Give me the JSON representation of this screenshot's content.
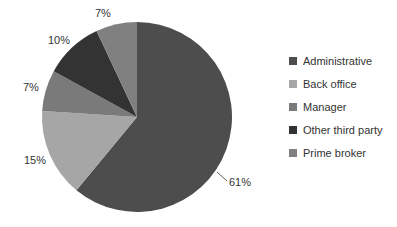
{
  "chart_data": {
    "type": "pie",
    "title": "",
    "categories": [
      "Administrative",
      "Back office",
      "Manager",
      "Other third party",
      "Prime broker"
    ],
    "values": [
      61,
      15,
      7,
      10,
      7
    ],
    "labels": [
      "61%",
      "15%",
      "7%",
      "10%",
      "7%"
    ],
    "colors": [
      "#4d4d4d",
      "#a6a6a6",
      "#7a7a7a",
      "#333333",
      "#808080"
    ],
    "legend_position": "right"
  },
  "legend": [
    {
      "label": "Administrative",
      "color": "#4d4d4d"
    },
    {
      "label": "Back office",
      "color": "#a6a6a6"
    },
    {
      "label": "Manager",
      "color": "#7a7a7a"
    },
    {
      "label": "Other third party",
      "color": "#333333"
    },
    {
      "label": "Prime broker",
      "color": "#808080"
    }
  ]
}
